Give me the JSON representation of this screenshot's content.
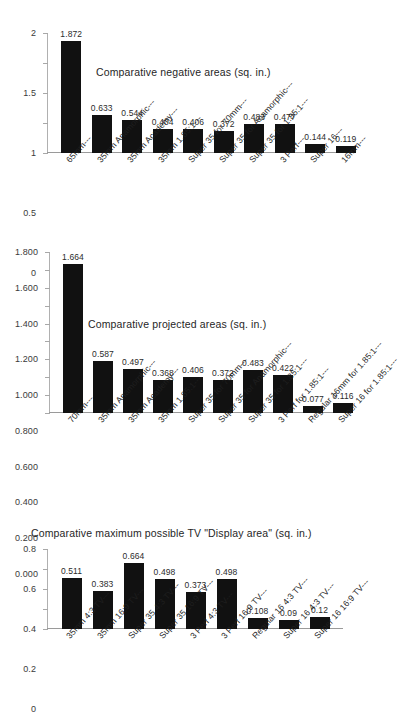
{
  "page": {
    "background": "#ffffff",
    "bar_color": "#111111",
    "text_color": "#1f1f1f",
    "axis_color": "#a8a8a8"
  },
  "chart_data": [
    {
      "id": "negative-areas",
      "type": "bar",
      "title": "Comparative  negative areas (sq. in.)",
      "xlabel": "",
      "ylabel": "",
      "ylim": [
        0,
        2
      ],
      "grid": false,
      "legend": "none",
      "yticks": [
        "0",
        "0.5",
        "1",
        "1.5",
        "2"
      ],
      "ytick_values": [
        0,
        0.5,
        1,
        1.5,
        2
      ],
      "categories": [
        "65mm---",
        "35mm Anamorphic---",
        "35mm Academy---",
        "35mm 1.85:1---",
        "Super 35 for 70mm---",
        "Super 35 for Anamorphic---",
        "Super 35 for 1.85:1---",
        "3 Perf---",
        "Super 16---",
        "16mm---"
      ],
      "values": [
        1.872,
        0.633,
        0.544,
        0.404,
        0.406,
        0.372,
        0.483,
        0.477,
        0.144,
        0.119
      ],
      "value_labels": [
        "1.872",
        "0.633",
        "0.544",
        "0.404",
        "0.406",
        "0.372",
        "0.483",
        "0.477",
        "0.144",
        "0.119"
      ]
    },
    {
      "id": "projected-areas",
      "type": "bar",
      "title": "Comparative  projected areas (sq. in.)",
      "xlabel": "",
      "ylabel": "",
      "ylim": [
        0,
        1.8
      ],
      "grid": false,
      "legend": "none",
      "yticks": [
        "0.000",
        "0.200",
        "0.400",
        "0.600",
        "0.800",
        "1.000",
        "1.200",
        "1.400",
        "1.600",
        "1.800"
      ],
      "ytick_values": [
        0,
        0.2,
        0.4,
        0.6,
        0.8,
        1.0,
        1.2,
        1.4,
        1.6,
        1.8
      ],
      "categories": [
        "70mm---",
        "35mm Anamorphic---",
        "35mm Academy---",
        "35mm 1.85:1---",
        "Super 35 for 70mm---",
        "Super 35 for Anamorphic---",
        "Super 35 for 1.85:1---",
        "3 Perf  for 1.85:1---",
        "Regular 16mm for 1.85:1---",
        "Super 16 for 1.85:1---"
      ],
      "values": [
        1.664,
        0.587,
        0.497,
        0.368,
        0.406,
        0.372,
        0.483,
        0.422,
        0.077,
        0.116
      ],
      "value_labels": [
        "1.664",
        "0.587",
        "0.497",
        "0.368",
        "0.406",
        "0.372",
        "0.483",
        "0.422",
        "0.077",
        "0.116"
      ]
    },
    {
      "id": "tv-display-areas",
      "type": "bar",
      "title": "Comparative  maximum possible TV \"Display area\" (sq. in.)",
      "xlabel": "",
      "ylabel": "",
      "ylim": [
        0,
        0.8
      ],
      "grid": false,
      "legend": "none",
      "yticks": [
        "0",
        "0.2",
        "0.4",
        "0.6",
        "0.8"
      ],
      "ytick_values": [
        0,
        0.2,
        0.4,
        0.6,
        0.8
      ],
      "categories": [
        "35mm 4:3 TV---",
        "35mm 16:9 TV---",
        "Super 35 4:3 TV---",
        "Super 35 16:9 TV---",
        "3 Perf 4:3 TV---",
        "3 Perf 16:9 TV---",
        "Regular 16 4:3 TV---",
        "Super 16 4:3 TV---",
        "Super 16 16:9 TV---"
      ],
      "values": [
        0.511,
        0.383,
        0.664,
        0.498,
        0.373,
        0.498,
        0.108,
        0.09,
        0.12
      ],
      "value_labels": [
        "0.511",
        "0.383",
        "0.664",
        "0.498",
        "0.373",
        "0.498",
        "0.108",
        "0.09",
        "0.12"
      ]
    }
  ]
}
